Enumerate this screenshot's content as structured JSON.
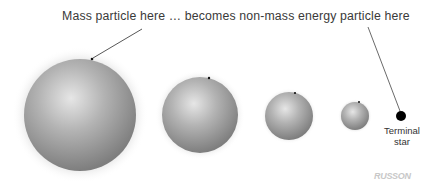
{
  "diagram": {
    "caption": "Mass particle here … becomes non-mass energy particle here",
    "terminal_label_line1": "Terminal",
    "terminal_label_line2": "star",
    "logo_text": "RUSSON",
    "colors": {
      "sphere_light": "#e6e6e6",
      "sphere_mid": "#a9a9a9",
      "sphere_dark": "#7c7c7c",
      "terminal_star": "#000000",
      "leader_line": "#444444",
      "text": "#3a3a3a"
    },
    "spheres": [
      {
        "name": "sphere-largest",
        "cx": 80,
        "cy": 115,
        "r": 56
      },
      {
        "name": "sphere-large",
        "cx": 200,
        "cy": 115,
        "r": 38
      },
      {
        "name": "sphere-medium",
        "cx": 289,
        "cy": 116,
        "r": 24
      },
      {
        "name": "sphere-small",
        "cx": 355,
        "cy": 116,
        "r": 14
      }
    ],
    "terminal_star": {
      "cx": 401,
      "cy": 116,
      "r": 5
    }
  }
}
